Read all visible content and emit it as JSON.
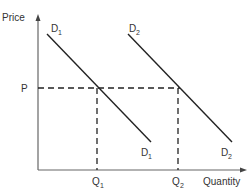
{
  "diagram": {
    "y_axis_label": "Price",
    "x_axis_label": "Quantity",
    "price_label": "P",
    "price_sub": "",
    "curves": [
      {
        "name": "D",
        "sub": "1",
        "label_top": "D",
        "label_bottom": "D"
      },
      {
        "name": "D",
        "sub": "2",
        "label_top": "D",
        "label_bottom": "D"
      }
    ],
    "quantities": [
      {
        "label": "Q",
        "sub": "1"
      },
      {
        "label": "Q",
        "sub": "2"
      }
    ],
    "colors": {
      "axis": "#555555",
      "line": "#222222",
      "dash": "#222222"
    }
  }
}
